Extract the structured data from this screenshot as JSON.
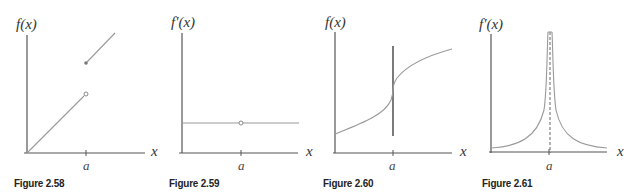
{
  "figures": [
    {
      "id": "2.58",
      "caption": "Figure 2.58",
      "y_label": "f(x)",
      "x_label": "x",
      "tick_label": "a",
      "description": "f(x) with jump discontinuity at a: line from origin to open circle at a, filled dot above at a, line continuing upward to the right"
    },
    {
      "id": "2.59",
      "caption": "Figure 2.59",
      "y_label": "f′(x)",
      "x_label": "x",
      "tick_label": "a",
      "description": "f'(x) constant horizontal line with open circle (hole) at a"
    },
    {
      "id": "2.60",
      "caption": "Figure 2.60",
      "y_label": "f(x)",
      "x_label": "x",
      "tick_label": "a",
      "description": "f(x) increasing curve with vertical tangent at a (solid vertical line at a)"
    },
    {
      "id": "2.61",
      "caption": "Figure 2.61",
      "y_label": "f′(x)",
      "x_label": "x",
      "tick_label": "a",
      "description": "f'(x) spikes to infinity at a, dashed vertical asymptote at a"
    }
  ],
  "colors": {
    "axis": "#555555",
    "curve": "#999999",
    "text": "#333333"
  }
}
